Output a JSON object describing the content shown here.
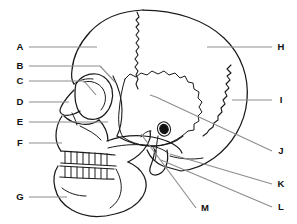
{
  "figure": {
    "name": "lateral-skull-diagram",
    "background_color": "#ffffff",
    "outline_color": "#1a1a1a",
    "leader_line_color": "#8d8d8d",
    "label_color": "#111111",
    "canvas": {
      "width": 297,
      "height": 224
    }
  },
  "labels": {
    "left": [
      {
        "id": "A",
        "letter": "A",
        "text_x": 20,
        "text_y": 47,
        "line_x1": 29,
        "line_y1": 47,
        "line_x2": 97,
        "line_y2": 47
      },
      {
        "id": "B",
        "letter": "B",
        "text_x": 20,
        "text_y": 66,
        "line_x1": 29,
        "line_y1": 66,
        "line_x2": 100,
        "line_y2": 66
      },
      {
        "id": "C",
        "letter": "C",
        "text_x": 20,
        "text_y": 81,
        "line_x1": 29,
        "line_y1": 81,
        "line_x2": 84,
        "line_y2": 81
      },
      {
        "id": "D",
        "letter": "D",
        "text_x": 20,
        "text_y": 102,
        "line_x1": 29,
        "line_y1": 102,
        "line_x2": 69,
        "line_y2": 102
      },
      {
        "id": "E",
        "letter": "E",
        "text_x": 20,
        "text_y": 122,
        "line_x1": 29,
        "line_y1": 122,
        "line_x2": 108,
        "line_y2": 122
      },
      {
        "id": "F",
        "letter": "F",
        "text_x": 20,
        "text_y": 143,
        "line_x1": 29,
        "line_y1": 143,
        "line_x2": 62,
        "line_y2": 143
      },
      {
        "id": "G",
        "letter": "G",
        "text_x": 20,
        "text_y": 197,
        "line_x1": 29,
        "line_y1": 197,
        "line_x2": 67,
        "line_y2": 197
      }
    ],
    "right": [
      {
        "id": "H",
        "letter": "H",
        "text_x": 281,
        "text_y": 47,
        "line_x1": 272,
        "line_y1": 47,
        "line_x2": 207,
        "line_y2": 47
      },
      {
        "id": "I",
        "letter": "I",
        "text_x": 281,
        "text_y": 100,
        "line_x1": 272,
        "line_y1": 100,
        "line_x2": 232,
        "line_y2": 100
      },
      {
        "id": "J",
        "letter": "J",
        "text_x": 281,
        "text_y": 151,
        "line_x1": 272,
        "line_y1": 151,
        "line_x2": 156,
        "line_y2": 97
      },
      {
        "id": "K",
        "letter": "K",
        "text_x": 281,
        "text_y": 184,
        "line_x1": 272,
        "line_y1": 184,
        "line_x2": 170,
        "line_y2": 154
      },
      {
        "id": "L",
        "letter": "L",
        "text_x": 281,
        "text_y": 207,
        "line_x1": 272,
        "line_y1": 207,
        "line_x2": 161,
        "line_y2": 160
      }
    ],
    "bottom": [
      {
        "id": "M",
        "letter": "M",
        "text_x": 205,
        "text_y": 208,
        "line_x1": 196,
        "line_y1": 208,
        "line_x2": 141,
        "line_y2": 134
      }
    ]
  },
  "label_order": [
    "A",
    "B",
    "C",
    "D",
    "E",
    "F",
    "G",
    "H",
    "I",
    "J",
    "K",
    "L",
    "M"
  ]
}
